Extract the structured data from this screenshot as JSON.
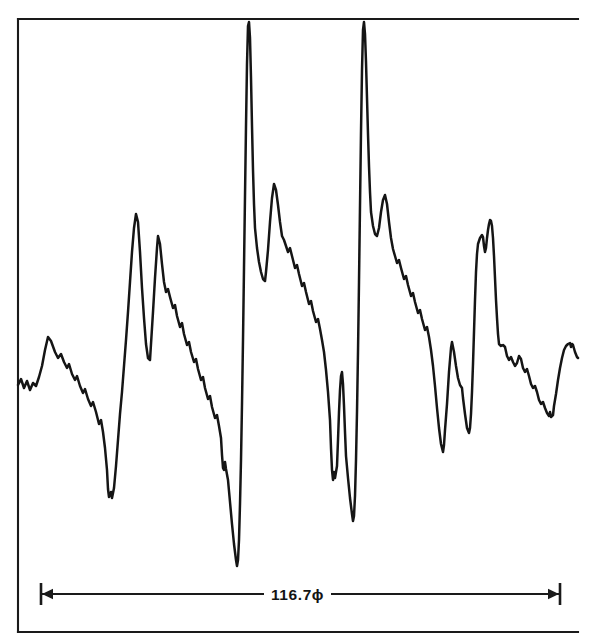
{
  "figure": {
    "kind": "analog-chart-recording",
    "background_color": "#ffffff",
    "ink_color": "#151515",
    "dimension": {
      "label": "116.7ϕ",
      "value": 116.7,
      "unit": "ϕ",
      "left_tick_x": 41,
      "right_tick_x": 560,
      "baseline_y": 594
    },
    "frame": {
      "left_x": 18,
      "top_y": 19,
      "bottom_y": 632,
      "right_extent_x": 578,
      "has_right_border": false
    }
  },
  "chart_data": {
    "type": "line",
    "title": "",
    "subtitle": "",
    "xlabel": "",
    "ylabel": "",
    "grid": false,
    "legend": null,
    "annotations": [
      {
        "name": "span-dimension",
        "text": "116.7ϕ",
        "type": "double-arrow-dimension",
        "x_start": 41,
        "x_end": 560,
        "y": 594
      }
    ],
    "xlim": [
      18,
      578
    ],
    "ylim": [
      632,
      19
    ],
    "y_axis_direction": "inverted-screen-pixels",
    "series": [
      {
        "name": "recorded-trace",
        "color": "#151515",
        "points": [
          [
            18,
            385
          ],
          [
            21,
            379
          ],
          [
            24,
            388
          ],
          [
            27,
            381
          ],
          [
            30,
            390
          ],
          [
            33,
            383
          ],
          [
            36,
            386
          ],
          [
            39,
            377
          ],
          [
            42,
            366
          ],
          [
            45,
            350
          ],
          [
            48,
            337
          ],
          [
            51,
            341
          ],
          [
            55,
            352
          ],
          [
            58,
            358
          ],
          [
            61,
            354
          ],
          [
            64,
            362
          ],
          [
            67,
            368
          ],
          [
            69,
            364
          ],
          [
            72,
            374
          ],
          [
            75,
            380
          ],
          [
            77,
            376
          ],
          [
            80,
            386
          ],
          [
            83,
            393
          ],
          [
            85,
            389
          ],
          [
            88,
            399
          ],
          [
            91,
            406
          ],
          [
            93,
            402
          ],
          [
            96,
            412
          ],
          [
            99,
            424
          ],
          [
            101,
            420
          ],
          [
            103,
            432
          ],
          [
            105,
            448
          ],
          [
            107,
            470
          ],
          [
            108,
            489
          ],
          [
            109,
            497
          ],
          [
            111,
            492
          ],
          [
            112,
            498
          ],
          [
            114,
            488
          ],
          [
            116,
            466
          ],
          [
            118,
            440
          ],
          [
            120,
            414
          ],
          [
            122,
            392
          ],
          [
            124,
            366
          ],
          [
            126,
            340
          ],
          [
            128,
            312
          ],
          [
            130,
            282
          ],
          [
            132,
            252
          ],
          [
            134,
            228
          ],
          [
            136,
            214
          ],
          [
            138,
            222
          ],
          [
            140,
            252
          ],
          [
            142,
            288
          ],
          [
            144,
            318
          ],
          [
            146,
            344
          ],
          [
            148,
            358
          ],
          [
            150,
            360
          ],
          [
            151,
            344
          ],
          [
            153,
            312
          ],
          [
            155,
            278
          ],
          [
            157,
            248
          ],
          [
            158,
            236
          ],
          [
            160,
            244
          ],
          [
            162,
            264
          ],
          [
            164,
            282
          ],
          [
            166,
            292
          ],
          [
            168,
            289
          ],
          [
            170,
            297
          ],
          [
            173,
            308
          ],
          [
            175,
            305
          ],
          [
            177,
            316
          ],
          [
            180,
            327
          ],
          [
            182,
            323
          ],
          [
            184,
            334
          ],
          [
            187,
            345
          ],
          [
            189,
            342
          ],
          [
            191,
            352
          ],
          [
            194,
            362
          ],
          [
            196,
            359
          ],
          [
            198,
            369
          ],
          [
            201,
            380
          ],
          [
            203,
            377
          ],
          [
            205,
            388
          ],
          [
            208,
            399
          ],
          [
            210,
            396
          ],
          [
            212,
            407
          ],
          [
            215,
            418
          ],
          [
            217,
            415
          ],
          [
            219,
            426
          ],
          [
            221,
            438
          ],
          [
            222,
            455
          ],
          [
            223,
            468
          ],
          [
            224,
            470
          ],
          [
            225,
            462
          ],
          [
            226,
            469
          ],
          [
            228,
            480
          ],
          [
            230,
            502
          ],
          [
            232,
            524
          ],
          [
            234,
            544
          ],
          [
            236,
            560
          ],
          [
            237,
            566
          ],
          [
            238,
            560
          ],
          [
            239,
            540
          ],
          [
            240,
            504
          ],
          [
            241,
            460
          ],
          [
            242,
            404
          ],
          [
            243,
            340
          ],
          [
            244,
            268
          ],
          [
            245,
            196
          ],
          [
            246,
            126
          ],
          [
            247,
            64
          ],
          [
            248,
            26
          ],
          [
            249,
            22
          ],
          [
            250,
            38
          ],
          [
            251,
            78
          ],
          [
            252,
            126
          ],
          [
            253,
            170
          ],
          [
            254,
            204
          ],
          [
            255,
            228
          ],
          [
            257,
            248
          ],
          [
            259,
            262
          ],
          [
            261,
            272
          ],
          [
            263,
            279
          ],
          [
            265,
            281
          ],
          [
            266,
            272
          ],
          [
            268,
            250
          ],
          [
            270,
            222
          ],
          [
            272,
            198
          ],
          [
            274,
            184
          ],
          [
            276,
            190
          ],
          [
            278,
            205
          ],
          [
            280,
            222
          ],
          [
            282,
            236
          ],
          [
            284,
            240
          ],
          [
            286,
            246
          ],
          [
            288,
            252
          ],
          [
            290,
            248
          ],
          [
            292,
            256
          ],
          [
            295,
            268
          ],
          [
            297,
            265
          ],
          [
            299,
            274
          ],
          [
            302,
            286
          ],
          [
            304,
            283
          ],
          [
            306,
            292
          ],
          [
            309,
            304
          ],
          [
            311,
            301
          ],
          [
            313,
            311
          ],
          [
            316,
            322
          ],
          [
            318,
            319
          ],
          [
            320,
            329
          ],
          [
            322,
            340
          ],
          [
            324,
            352
          ],
          [
            326,
            370
          ],
          [
            328,
            392
          ],
          [
            330,
            420
          ],
          [
            331,
            448
          ],
          [
            332,
            470
          ],
          [
            333,
            480
          ],
          [
            334,
            472
          ],
          [
            335,
            478
          ],
          [
            337,
            466
          ],
          [
            338,
            440
          ],
          [
            339,
            412
          ],
          [
            340,
            390
          ],
          [
            341,
            376
          ],
          [
            342,
            372
          ],
          [
            343,
            384
          ],
          [
            344,
            406
          ],
          [
            345,
            432
          ],
          [
            346,
            456
          ],
          [
            348,
            478
          ],
          [
            350,
            498
          ],
          [
            352,
            514
          ],
          [
            353,
            521
          ],
          [
            354,
            516
          ],
          [
            355,
            496
          ],
          [
            356,
            460
          ],
          [
            357,
            412
          ],
          [
            358,
            352
          ],
          [
            359,
            282
          ],
          [
            360,
            206
          ],
          [
            361,
            132
          ],
          [
            362,
            70
          ],
          [
            363,
            30
          ],
          [
            364,
            22
          ],
          [
            365,
            34
          ],
          [
            366,
            62
          ],
          [
            367,
            98
          ],
          [
            368,
            134
          ],
          [
            369,
            166
          ],
          [
            370,
            192
          ],
          [
            371,
            212
          ],
          [
            373,
            226
          ],
          [
            375,
            234
          ],
          [
            377,
            236
          ],
          [
            379,
            228
          ],
          [
            381,
            212
          ],
          [
            383,
            200
          ],
          [
            385,
            195
          ],
          [
            387,
            204
          ],
          [
            389,
            222
          ],
          [
            391,
            238
          ],
          [
            393,
            249
          ],
          [
            395,
            256
          ],
          [
            397,
            263
          ],
          [
            399,
            260
          ],
          [
            401,
            268
          ],
          [
            404,
            279
          ],
          [
            406,
            276
          ],
          [
            408,
            285
          ],
          [
            411,
            296
          ],
          [
            413,
            293
          ],
          [
            415,
            302
          ],
          [
            418,
            313
          ],
          [
            420,
            310
          ],
          [
            422,
            319
          ],
          [
            425,
            330
          ],
          [
            427,
            327
          ],
          [
            429,
            337
          ],
          [
            431,
            350
          ],
          [
            433,
            366
          ],
          [
            435,
            386
          ],
          [
            437,
            408
          ],
          [
            439,
            428
          ],
          [
            441,
            444
          ],
          [
            443,
            452
          ],
          [
            444,
            445
          ],
          [
            445,
            430
          ],
          [
            447,
            404
          ],
          [
            449,
            372
          ],
          [
            451,
            348
          ],
          [
            452,
            342
          ],
          [
            454,
            352
          ],
          [
            456,
            366
          ],
          [
            458,
            378
          ],
          [
            460,
            385
          ],
          [
            462,
            388
          ],
          [
            463,
            398
          ],
          [
            465,
            414
          ],
          [
            467,
            428
          ],
          [
            469,
            433
          ],
          [
            470,
            428
          ],
          [
            471,
            414
          ],
          [
            472,
            392
          ],
          [
            473,
            364
          ],
          [
            474,
            332
          ],
          [
            475,
            300
          ],
          [
            476,
            272
          ],
          [
            477,
            254
          ],
          [
            478,
            244
          ],
          [
            480,
            238
          ],
          [
            482,
            235
          ],
          [
            483,
            237
          ],
          [
            484,
            246
          ],
          [
            485,
            252
          ],
          [
            486,
            248
          ],
          [
            487,
            238
          ],
          [
            488,
            230
          ],
          [
            489,
            224
          ],
          [
            490,
            220
          ],
          [
            491,
            221
          ],
          [
            492,
            226
          ],
          [
            493,
            238
          ],
          [
            494,
            256
          ],
          [
            495,
            278
          ],
          [
            496,
            300
          ],
          [
            497,
            318
          ],
          [
            498,
            334
          ],
          [
            499,
            344
          ],
          [
            501,
            346
          ],
          [
            503,
            345
          ],
          [
            505,
            347
          ],
          [
            507,
            356
          ],
          [
            509,
            360
          ],
          [
            511,
            357
          ],
          [
            513,
            362
          ],
          [
            515,
            366
          ],
          [
            517,
            363
          ],
          [
            519,
            356
          ],
          [
            521,
            359
          ],
          [
            523,
            368
          ],
          [
            525,
            372
          ],
          [
            527,
            369
          ],
          [
            529,
            376
          ],
          [
            531,
            384
          ],
          [
            533,
            388
          ],
          [
            535,
            386
          ],
          [
            537,
            392
          ],
          [
            539,
            400
          ],
          [
            541,
            404
          ],
          [
            543,
            402
          ],
          [
            545,
            408
          ],
          [
            547,
            413
          ],
          [
            549,
            416
          ],
          [
            550,
            412
          ],
          [
            551,
            417
          ],
          [
            553,
            415
          ],
          [
            554,
            406
          ],
          [
            556,
            394
          ],
          [
            558,
            380
          ],
          [
            560,
            368
          ],
          [
            562,
            358
          ],
          [
            564,
            350
          ],
          [
            566,
            346
          ],
          [
            568,
            344
          ],
          [
            570,
            343
          ],
          [
            571,
            347
          ],
          [
            572,
            344
          ],
          [
            573,
            345
          ],
          [
            575,
            352
          ],
          [
            577,
            357
          ],
          [
            578,
            358
          ]
        ]
      }
    ]
  }
}
